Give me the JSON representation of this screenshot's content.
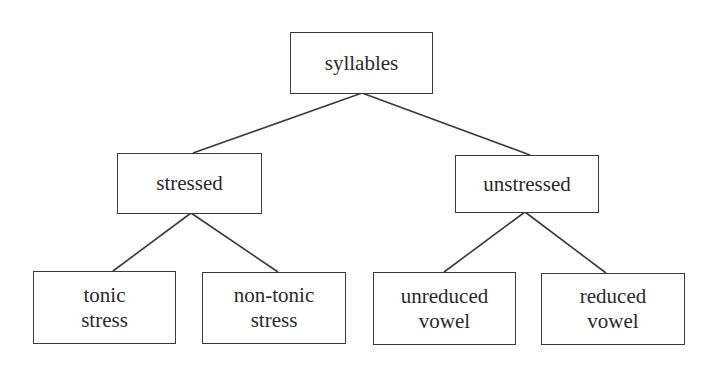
{
  "diagram": {
    "type": "tree",
    "root": {
      "id": "syllables",
      "label": [
        "syllables"
      ],
      "children": [
        "stressed",
        "unstressed"
      ]
    },
    "nodes": {
      "syllables": {
        "lines": [
          "syllables"
        ]
      },
      "stressed": {
        "lines": [
          "stressed"
        ]
      },
      "unstressed": {
        "lines": [
          "unstressed"
        ]
      },
      "tonic_stress": {
        "lines": [
          "tonic",
          "stress"
        ]
      },
      "non_tonic_stress": {
        "lines": [
          "non-tonic",
          "stress"
        ]
      },
      "unreduced_vowel": {
        "lines": [
          "unreduced",
          "vowel"
        ]
      },
      "reduced_vowel": {
        "lines": [
          "reduced",
          "vowel"
        ]
      }
    },
    "edges": [
      [
        "syllables",
        "stressed"
      ],
      [
        "syllables",
        "unstressed"
      ],
      [
        "stressed",
        "tonic_stress"
      ],
      [
        "stressed",
        "non_tonic_stress"
      ],
      [
        "unstressed",
        "unreduced_vowel"
      ],
      [
        "unstressed",
        "reduced_vowel"
      ]
    ]
  }
}
